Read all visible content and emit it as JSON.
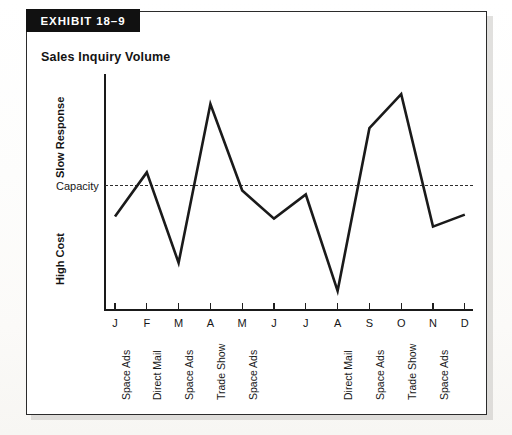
{
  "exhibit": {
    "banner": "EXHIBIT 18–9"
  },
  "chart_title": "Sales Inquiry Volume",
  "colors": {
    "line": "#1a1a1a",
    "axis": "#1a1a1a",
    "capacity": "#2e2e2e",
    "banner_bg": "#111111",
    "banner_text": "#ffffff",
    "frame": "#2b2b2b",
    "page_bg": "#ffffff"
  },
  "axis_labels": {
    "top": "Slow Response",
    "middle": "Capacity",
    "bottom": "High Cost"
  },
  "chart_data": {
    "type": "line",
    "title": "Sales Inquiry Volume",
    "xlabel": "",
    "ylabel": "",
    "grid": false,
    "legend": "none",
    "axis_tick_labels_shown": false,
    "categories": [
      "J",
      "F",
      "M",
      "A",
      "M",
      "J",
      "J",
      "A",
      "S",
      "O",
      "N",
      "D"
    ],
    "months_full": [
      "January",
      "February",
      "March",
      "April",
      "May",
      "June",
      "July",
      "August",
      "September",
      "October",
      "November",
      "December"
    ],
    "campaigns": [
      "Space Ads",
      "Direct Mail",
      "Space Ads",
      "Trade Show",
      "Space Ads",
      "",
      "",
      "Direct Mail",
      "Space Ads",
      "Trade Show",
      "Space Ads",
      ""
    ],
    "values": [
      46,
      68,
      23,
      102,
      59,
      45,
      57,
      9,
      90,
      107,
      41,
      47
    ],
    "ylim": [
      0,
      115
    ],
    "annotations": [
      {
        "label": "Capacity",
        "type": "horizontal-reference-line",
        "value": 59
      },
      {
        "label": "Slow Response",
        "type": "axis-zone",
        "position": "upper"
      },
      {
        "label": "High Cost",
        "type": "axis-zone",
        "position": "lower"
      }
    ]
  }
}
